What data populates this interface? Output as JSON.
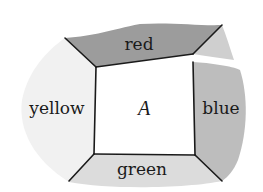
{
  "diagram": {
    "type": "region-map",
    "center_region": {
      "label": "A"
    },
    "regions": [
      {
        "id": "top",
        "label": "red",
        "fill": "#9c9c9c"
      },
      {
        "id": "right",
        "label": "blue",
        "fill": "#bdbdbd"
      },
      {
        "id": "bottom",
        "label": "green",
        "fill": "#dcdcdc"
      },
      {
        "id": "left",
        "label": "yellow",
        "fill": "#f1f1f1"
      }
    ],
    "extra_fill": "#cfcfcf",
    "center_fill": "#ffffff",
    "edge_color": "#1a1a1a"
  }
}
